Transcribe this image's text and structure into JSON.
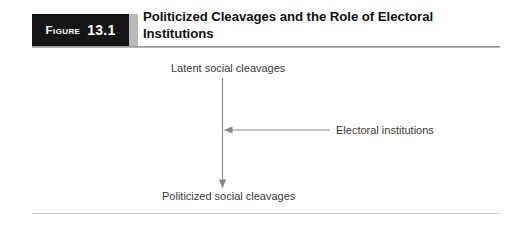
{
  "figure": {
    "label_word": "Figure",
    "number": "13.1",
    "title": "Politicized Cleavages and the Role of Electoral Institutions"
  },
  "diagram": {
    "type": "flow",
    "nodes": [
      {
        "id": "latent",
        "label": "Latent social cleavages"
      },
      {
        "id": "politicized",
        "label": "Politicized social cleavages"
      },
      {
        "id": "electoral",
        "label": "Electoral institutions"
      }
    ],
    "edges": [
      {
        "from": "latent",
        "to": "politicized",
        "direction": "down",
        "arrowhead": true
      },
      {
        "from": "electoral",
        "to": "latent-to-politicized-edge",
        "direction": "left",
        "arrowhead": true
      }
    ]
  },
  "colors": {
    "figure_box_background": "#151515",
    "figure_box_text": "#ffffff",
    "figure_strip": "#b9b9b9",
    "title_text": "#111111",
    "body_text": "#3a3a3a",
    "rule": "#9a9a9a",
    "arrow": "#7a7a7a",
    "page_background": "#ffffff"
  }
}
